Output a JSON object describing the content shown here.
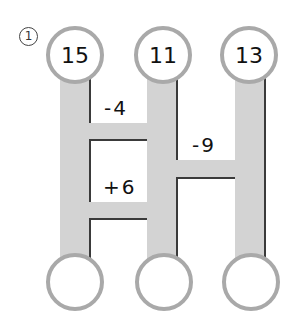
{
  "problem_number": "1",
  "top_values": [
    "15",
    "11",
    "13"
  ],
  "bottom_values": [
    "",
    "",
    ""
  ],
  "rungs": [
    {
      "between": "left-middle",
      "label": "-4"
    },
    {
      "between": "middle-right",
      "label": "-9"
    },
    {
      "between": "left-middle",
      "label": "+6"
    }
  ],
  "colors": {
    "bar": "#d3d3d3",
    "circle_border": "#a9a9a9",
    "edge": "#3a3a3a"
  }
}
